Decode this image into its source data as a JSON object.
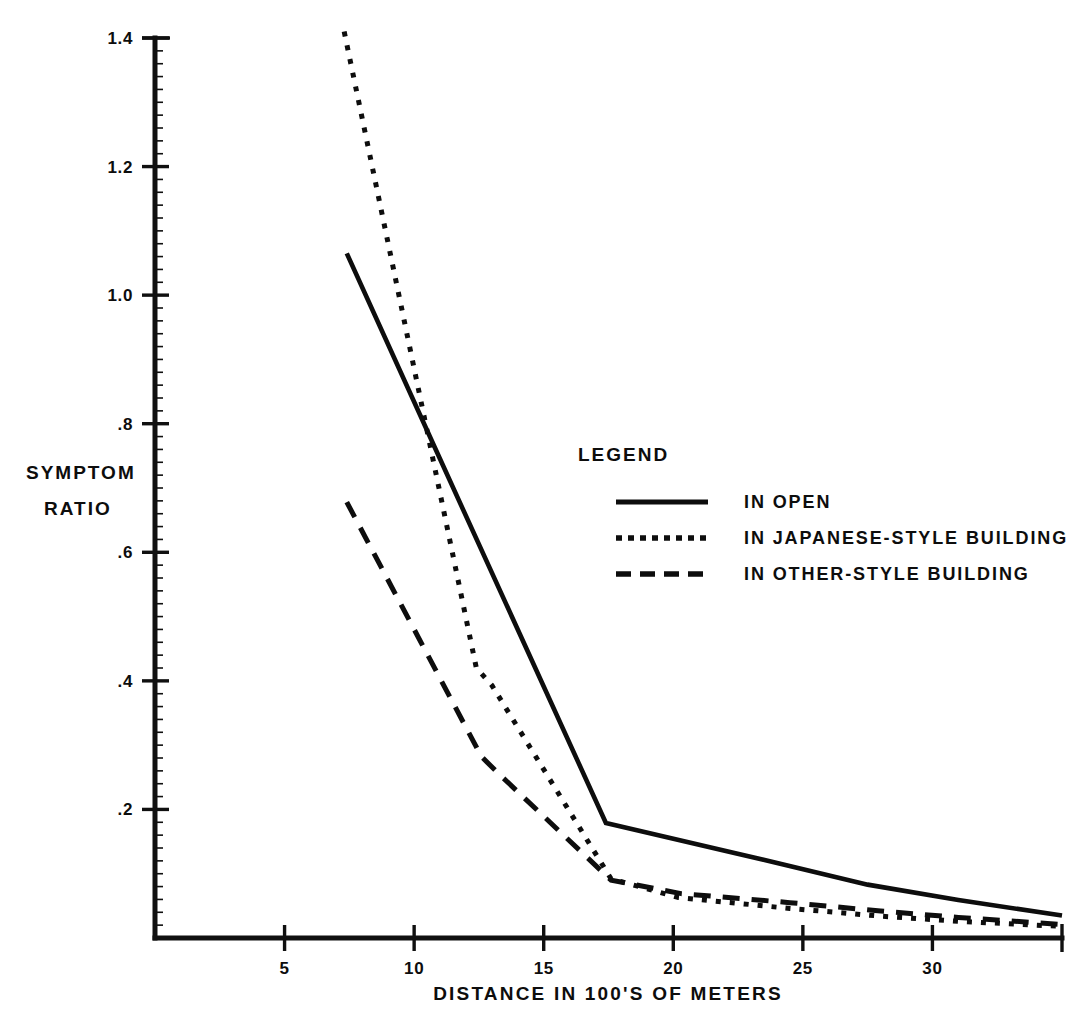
{
  "chart_data": {
    "type": "line",
    "title": "",
    "xlabel": "DISTANCE IN 100'S OF METERS",
    "ylabel": "SYMPTOM RATIO",
    "ylabel_lines": [
      "SYMPTOM",
      "RATIO"
    ],
    "xlim": [
      0,
      35
    ],
    "ylim": [
      0,
      1.4
    ],
    "grid": false,
    "xticks": [
      5,
      10,
      15,
      20,
      25,
      30
    ],
    "xtick_labels": [
      "5",
      "10",
      "15",
      "20",
      "25",
      "30"
    ],
    "yticks": [
      0.2,
      0.4,
      0.6,
      0.8,
      1.0,
      1.2,
      1.4
    ],
    "ytick_labels": [
      ".2",
      ".4",
      ".6",
      ".8",
      "1.0",
      "1.2",
      "1.4"
    ],
    "legend_position": "center-right",
    "legend_title": "LEGEND",
    "series": [
      {
        "name": "IN OPEN",
        "style": "solid",
        "x": [
          7.4,
          11.0,
          17.4,
          22.4,
          27.5,
          31.0,
          35.0
        ],
        "y": [
          1.065,
          0.745,
          0.179,
          0.132,
          0.083,
          0.059,
          0.035
        ]
      },
      {
        "name": "IN JAPANESE-STYLE BUILDING",
        "style": "dotted",
        "x": [
          7.3,
          12.4,
          13.0,
          17.6,
          20.2,
          24.5,
          28.0,
          31.0,
          35.0
        ],
        "y": [
          1.41,
          0.42,
          0.393,
          0.092,
          0.063,
          0.046,
          0.034,
          0.026,
          0.018
        ]
      },
      {
        "name": "IN OTHER-STYLE BUILDING",
        "style": "dashed",
        "x": [
          7.4,
          12.6,
          13.2,
          17.6,
          20.3,
          24.5,
          28.0,
          31.0,
          35.0
        ],
        "y": [
          0.678,
          0.282,
          0.258,
          0.09,
          0.069,
          0.055,
          0.042,
          0.032,
          0.021
        ]
      }
    ]
  },
  "axes": {
    "x_axis_name": "distance-axis",
    "y_axis_name": "symptom-ratio-axis"
  }
}
